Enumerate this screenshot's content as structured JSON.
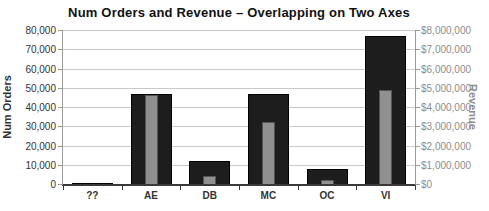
{
  "chart_data": {
    "type": "bar",
    "title": "Num Orders and Revenue – Overlapping on Two Axes",
    "categories": [
      "??",
      "AE",
      "DB",
      "MC",
      "OC",
      "VI"
    ],
    "series": [
      {
        "name": "Num Orders",
        "axis": "left",
        "color": "#1d1d1d",
        "border_color": "#000000",
        "bar_width": 41,
        "values": [
          500,
          47000,
          12000,
          47000,
          8000,
          77000
        ]
      },
      {
        "name": "Revenue",
        "axis": "right",
        "color": "#909090",
        "border_color": "#555555",
        "bar_width": 13,
        "values": [
          0,
          4600000,
          400000,
          3200000,
          200000,
          4900000
        ]
      }
    ],
    "left_axis": {
      "label": "Num Orders",
      "min": 0,
      "max": 80000,
      "step": 10000,
      "tick_labels": [
        "0",
        "10,000",
        "20,000",
        "30,000",
        "40,000",
        "50,000",
        "60,000",
        "70,000",
        "80,000"
      ]
    },
    "right_axis": {
      "label": "Revenue",
      "min": 0,
      "max": 8000000,
      "step": 1000000,
      "tick_labels": [
        "$0",
        "$1,000,000",
        "$2,000,000",
        "$3,000,000",
        "$4,000,000",
        "$5,000,000",
        "$6,000,000",
        "$7,000,000",
        "$8,000,000"
      ]
    },
    "grid": true,
    "legend": "none",
    "colors": {
      "grid": "#c9c9c9",
      "axis": "#9a9a9a",
      "baseline": "#3a3a3a",
      "left_tick_text": "#333333",
      "right_tick_text": "#8c8c8c",
      "category_text": "#333333",
      "title_text": "#111111",
      "background": "#ffffff"
    }
  }
}
